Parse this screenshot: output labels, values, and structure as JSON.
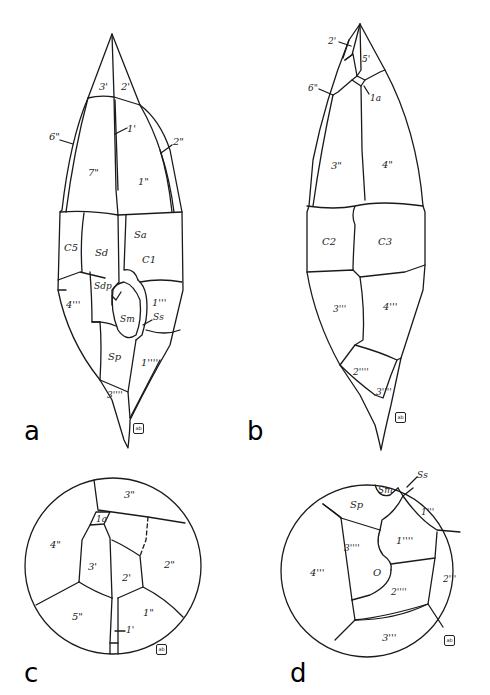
{
  "figure": {
    "panels": [
      {
        "letter": "a",
        "view": "ventral",
        "plates": {
          "p3p": "3'",
          "p2p": "2'",
          "p1p": "1'",
          "p6pp": "6\"",
          "p1pp": "1\"",
          "p7pp": "7\"",
          "p2pp": "2\"",
          "C5": "C5",
          "Sd": "Sd",
          "Sa": "Sa",
          "C1": "C1",
          "p4ppp": "4'''",
          "Sdp": "Sdp",
          "p1ppp": "1'''",
          "Sm": "Sm",
          "Ss": "Ss",
          "Sp": "Sp",
          "p1pppp": "1''''",
          "p3pppp": "3''''"
        },
        "signature": "ab"
      },
      {
        "letter": "b",
        "view": "dorsal",
        "plates": {
          "p2p": "2'",
          "p5p": "5'",
          "p6pp": "6\"",
          "p1a": "1a",
          "p3pp": "3\"",
          "p4pp": "4\"",
          "C2": "C2",
          "C3": "C3",
          "p3ppp": "3'''",
          "p4ppp": "4'''",
          "p2pppp": "2''''",
          "p3pppp": "3''''"
        },
        "signature": "ab"
      },
      {
        "letter": "c",
        "view": "apical",
        "plates": {
          "p3pp": "3\"",
          "p1a": "1a",
          "p4pp": "4\"",
          "p3p": "3'",
          "p2p": "2'",
          "p2pp": "2\"",
          "p5pp": "5\"",
          "p1pp": "1\"",
          "p1p": "1'"
        },
        "signature": "ab"
      },
      {
        "letter": "d",
        "view": "antapical",
        "plates": {
          "Sm": "Sm",
          "Ss": "Ss",
          "Sp": "Sp",
          "p1ppp": "1'''",
          "p1pppp": "1''''",
          "p3pppp": "3''''",
          "p4ppp": "4'''",
          "O": "O",
          "p2pppp": "2''''",
          "p2ppp": "2'''",
          "p3ppp": "3'''"
        },
        "signature": "ab"
      }
    ]
  }
}
